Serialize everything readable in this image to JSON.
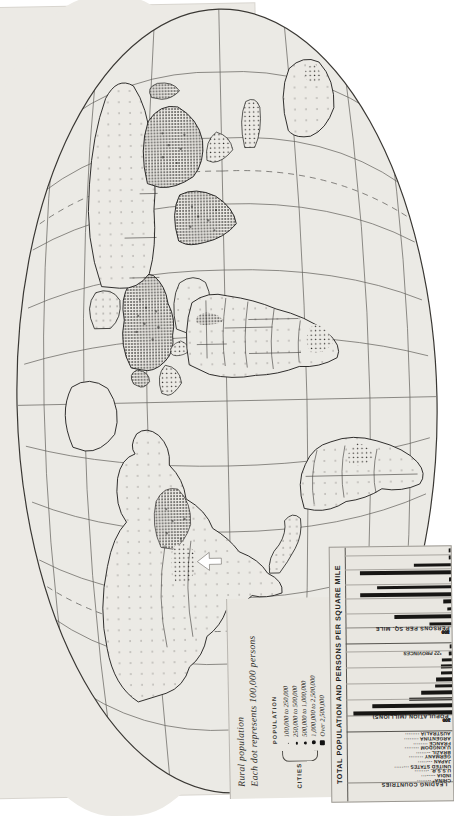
{
  "map": {
    "title": "World dot-density population map",
    "projection": "oval / globular world projection",
    "sheet_color": "#eceae5",
    "ink_color": "#1a1917"
  },
  "legend": {
    "rural_title": "Rural population",
    "rural_subtitle": "Each dot represents 100,000 persons",
    "population_header": "POPULATION",
    "cities_header": "CITIES",
    "classes": [
      {
        "symbol": "dot-xs",
        "label": "100,000 to 250,000"
      },
      {
        "symbol": "dot-sm",
        "label": "250,000 to 500,000"
      },
      {
        "symbol": "dot-md",
        "label": "500,000 to 1,000,000"
      },
      {
        "symbol": "dot-lg",
        "label": "1,000,000 to 2,500,000"
      },
      {
        "symbol": "square",
        "label": "Over 2,500,000"
      }
    ]
  },
  "chart_data": {
    "type": "bar",
    "title": "TOTAL POPULATION AND PERSONS PER SQUARE MILE",
    "row_header": "LEADING COUNTRIES",
    "categories": [
      "CHINA*",
      "INDIA",
      "U.S.S.R.",
      "UNITED STATES",
      "JAPAN",
      "GERMANY",
      "BRAZIL",
      "U.KINGDOM",
      "FRANCE",
      "ARGENTINA",
      "AUSTRALIA"
    ],
    "annotation": "*22 PROVINCES",
    "grid": true,
    "legend_position": "none",
    "panels": [
      {
        "name": "population",
        "axis_title": "POPULATION (MILLIONS)",
        "ticks": [
          100,
          200,
          300,
          400
        ],
        "xlim": [
          0,
          450
        ],
        "values": [
          422,
          338,
          182,
          132,
          73,
          69,
          45,
          48,
          42,
          14,
          7
        ]
      },
      {
        "name": "density",
        "axis_title": "PERSONS PER SQ. MILE",
        "ticks": [
          100,
          200,
          300,
          400,
          500
        ],
        "xlim": [
          0,
          560
        ],
        "values": [
          115,
          300,
          22,
          44,
          480,
          390,
          13,
          480,
          196,
          12,
          2
        ]
      }
    ]
  }
}
